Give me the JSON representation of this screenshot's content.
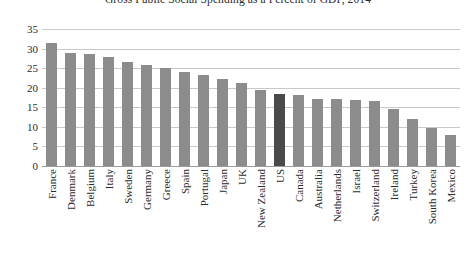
{
  "chart_data": {
    "type": "bar",
    "title": "Gross Public Social Spending as a Percent of GDP, 2014",
    "xlabel": "",
    "ylabel": "",
    "ylim": [
      0,
      35
    ],
    "ytick_values": [
      0,
      5,
      10,
      15,
      20,
      25,
      30,
      35
    ],
    "ytick_labels": [
      "0",
      "5",
      "10",
      "15",
      "20",
      "25",
      "30",
      "35"
    ],
    "grid": true,
    "legend": "none",
    "highlight_category": "US",
    "colors": {
      "bar": "#8c8c8c",
      "bar_highlight": "#4a4a4a",
      "gridline": "#c9c9c9",
      "axis": "#9a9a9a",
      "text": "#2b2b2b",
      "background": "#ffffff"
    },
    "categories": [
      "France",
      "Denmark",
      "Belgium",
      "Italy",
      "Sweden",
      "Germany",
      "Greece",
      "Spain",
      "Portugal",
      "Japan",
      "UK",
      "New Zealand",
      "US",
      "Canada",
      "Australia",
      "Netherlands",
      "Israel",
      "Switzerland",
      "Ireland",
      "Turkey",
      "South Korea",
      "Mexico"
    ],
    "values": [
      31.5,
      28.8,
      28.7,
      27.8,
      26.5,
      25.8,
      25.0,
      24.0,
      23.2,
      22.2,
      21.2,
      19.4,
      18.4,
      18.2,
      17.0,
      17.0,
      16.8,
      16.5,
      14.5,
      12.0,
      9.7,
      7.8
    ]
  }
}
